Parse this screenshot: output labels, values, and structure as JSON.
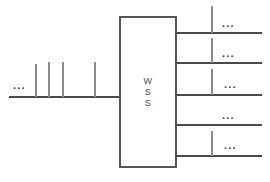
{
  "diagram": {
    "colors": {
      "background": "#ffffff",
      "line": "#4a4a4a",
      "tick": "#8c8c8c",
      "box_border": "#555555",
      "text": "#4a4a4a"
    },
    "device": {
      "label_lines": [
        "W",
        "S",
        "S"
      ],
      "box": {
        "x": 119,
        "y": 16,
        "width": 58,
        "height": 152
      }
    },
    "input": {
      "name": "input-fiber",
      "ellipsis": "...",
      "ellipsis_pos": {
        "x": 13,
        "y": 80
      },
      "baseline": {
        "x": 9,
        "y": 96,
        "width": 112
      },
      "channels": [
        {
          "name": "input-channel-1",
          "x": 35,
          "y": 64,
          "height": 33
        },
        {
          "name": "input-channel-2",
          "x": 48,
          "y": 62,
          "height": 35
        },
        {
          "name": "input-channel-3",
          "x": 62,
          "y": 62,
          "height": 35
        },
        {
          "name": "input-channel-4",
          "x": 94,
          "y": 62,
          "height": 35
        }
      ]
    },
    "outputs": [
      {
        "name": "output-port-1",
        "ellipsis": "...",
        "ellipsis_pos": {
          "x": 222,
          "y": 18
        },
        "baseline": {
          "x": 175,
          "y": 32,
          "width": 87
        },
        "tick": {
          "x": 211,
          "y": 6,
          "height": 27
        }
      },
      {
        "name": "output-port-2",
        "ellipsis": "...",
        "ellipsis_pos": {
          "x": 222,
          "y": 48
        },
        "baseline": {
          "x": 175,
          "y": 62,
          "width": 87
        },
        "tick": {
          "x": 211,
          "y": 38,
          "height": 25
        }
      },
      {
        "name": "output-port-3",
        "ellipsis": "...",
        "ellipsis_pos": {
          "x": 224,
          "y": 79
        },
        "baseline": {
          "x": 175,
          "y": 94,
          "width": 87
        },
        "tick": {
          "x": 211,
          "y": 69,
          "height": 26
        }
      },
      {
        "name": "output-port-4",
        "ellipsis": "...",
        "ellipsis_pos": {
          "x": 222,
          "y": 110
        },
        "baseline": {
          "x": 175,
          "y": 124,
          "width": 87
        },
        "tick": null
      },
      {
        "name": "output-port-5",
        "ellipsis": "...",
        "ellipsis_pos": {
          "x": 224,
          "y": 140
        },
        "baseline": {
          "x": 175,
          "y": 155,
          "width": 87
        },
        "tick": {
          "x": 211,
          "y": 131,
          "height": 25
        }
      }
    ]
  }
}
